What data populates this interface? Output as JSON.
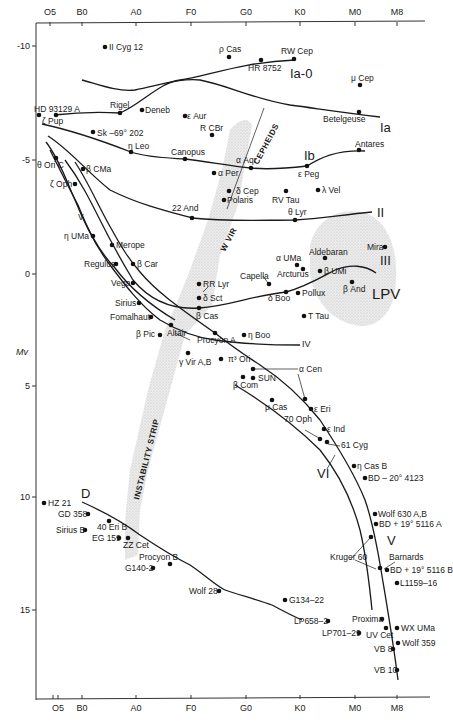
{
  "chart_data": {
    "type": "scatter",
    "xlabel": "Spectral type",
    "ylabel": "Mv",
    "x_ticks": [
      "O5",
      "B0",
      "A0",
      "F0",
      "G0",
      "K0",
      "M0",
      "M8"
    ],
    "y_ticks": [
      "-10",
      "-5",
      "0",
      "5",
      "10",
      "15"
    ],
    "ylim": [
      -11,
      18.5
    ],
    "y_inverted": true,
    "grid": false,
    "luminosity_classes": [
      "Ia-0",
      "Ia",
      "Ib",
      "II",
      "III",
      "IV",
      "V",
      "VI",
      "D"
    ],
    "regions": [
      "CEPHEIDS",
      "W VIR",
      "INSTABILITY STRIP",
      "LPV"
    ],
    "stars": [
      {
        "name": "II Cyg 12",
        "x": 105,
        "y": 47
      },
      {
        "name": "ρ Cas",
        "x": 229,
        "y": 57
      },
      {
        "name": "RW Cep",
        "x": 294,
        "y": 59
      },
      {
        "name": "HR 8752",
        "x": 261,
        "y": 60
      },
      {
        "name": "μ Cep",
        "x": 360,
        "y": 85
      },
      {
        "name": "HD 93129 A",
        "x": 39,
        "y": 115
      },
      {
        "name": "ζ Pup",
        "x": 56,
        "y": 115
      },
      {
        "name": "Rigel",
        "x": 120,
        "y": 113
      },
      {
        "name": "Deneb",
        "x": 142,
        "y": 110
      },
      {
        "name": "ε Aur",
        "x": 185,
        "y": 116
      },
      {
        "name": "Betelgeuse",
        "x": 359,
        "y": 112
      },
      {
        "name": "R CBr",
        "x": 212,
        "y": 135
      },
      {
        "name": "Sk -69° 202",
        "x": 93,
        "y": 132
      },
      {
        "name": "η Leo",
        "x": 131,
        "y": 152
      },
      {
        "name": "Canopus",
        "x": 185,
        "y": 159
      },
      {
        "name": "Antares",
        "x": 359,
        "y": 150
      },
      {
        "name": "α Aqr",
        "x": 251,
        "y": 168
      },
      {
        "name": "ε Peg",
        "x": 307,
        "y": 166
      },
      {
        "name": "θ Ori C",
        "x": 56,
        "y": 158
      },
      {
        "name": "β CMa",
        "x": 83,
        "y": 169
      },
      {
        "name": "α Per",
        "x": 214,
        "y": 173
      },
      {
        "name": "ζ Oph",
        "x": 75,
        "y": 184
      },
      {
        "name": "δ Cep",
        "x": 229,
        "y": 191
      },
      {
        "name": "Polaris",
        "x": 224,
        "y": 200
      },
      {
        "name": "RV Tau",
        "x": 286,
        "y": 191
      },
      {
        "name": "λ Vel",
        "x": 318,
        "y": 190
      },
      {
        "name": "22 And",
        "x": 192,
        "y": 218
      },
      {
        "name": "θ Lyr",
        "x": 295,
        "y": 220
      },
      {
        "name": "η UMa",
        "x": 93,
        "y": 236
      },
      {
        "name": "Merope",
        "x": 112,
        "y": 245
      },
      {
        "name": "Mira",
        "x": 385,
        "y": 247
      },
      {
        "name": "Aldebaran",
        "x": 325,
        "y": 258
      },
      {
        "name": "α UMa",
        "x": 297,
        "y": 265
      },
      {
        "name": "Arcturus",
        "x": 303,
        "y": 269
      },
      {
        "name": "β UMi",
        "x": 320,
        "y": 271
      },
      {
        "name": "Regulus",
        "x": 116,
        "y": 264
      },
      {
        "name": "β Car",
        "x": 133,
        "y": 264
      },
      {
        "name": "β And",
        "x": 352,
        "y": 282
      },
      {
        "name": "Capella",
        "x": 269,
        "y": 284
      },
      {
        "name": "RR Lyr",
        "x": 199,
        "y": 284
      },
      {
        "name": "δ Boo",
        "x": 286,
        "y": 292
      },
      {
        "name": "Pollux",
        "x": 298,
        "y": 293
      },
      {
        "name": "Vega",
        "x": 133,
        "y": 283
      },
      {
        "name": "δ Sct",
        "x": 199,
        "y": 298
      },
      {
        "name": "Sirius",
        "x": 139,
        "y": 303
      },
      {
        "name": "β Cas",
        "x": 199,
        "y": 308
      },
      {
        "name": "T Tau",
        "x": 304,
        "y": 316
      },
      {
        "name": "Fomalhaut",
        "x": 151,
        "y": 317
      },
      {
        "name": "Altair",
        "x": 171,
        "y": 325
      },
      {
        "name": "β Pic",
        "x": 160,
        "y": 335
      },
      {
        "name": "Procyon A",
        "x": 215,
        "y": 333
      },
      {
        "name": "η Boo",
        "x": 244,
        "y": 335
      },
      {
        "name": "γ Vir A,B",
        "x": 188,
        "y": 353
      },
      {
        "name": "π³ Ori",
        "x": 221,
        "y": 359
      },
      {
        "name": "α Cen",
        "x": 253,
        "y": 369
      },
      {
        "name": "SUN",
        "x": 253,
        "y": 378
      },
      {
        "name": "β Com",
        "x": 243,
        "y": 377
      },
      {
        "name": "μ Cas",
        "x": 272,
        "y": 400
      },
      {
        "name": "α Cen (B)",
        "x": 305,
        "y": 399
      },
      {
        "name": "ε Eri",
        "x": 311,
        "y": 409
      },
      {
        "name": "ε Ind",
        "x": 324,
        "y": 429
      },
      {
        "name": "70 Oph",
        "x": 320,
        "y": 439
      },
      {
        "name": "61 Cyg",
        "x": 327,
        "y": 442
      },
      {
        "name": "η Cas B",
        "x": 354,
        "y": 466
      },
      {
        "name": "BD -20° 4123",
        "x": 365,
        "y": 478
      },
      {
        "name": "Wolf 630 A,B",
        "x": 375,
        "y": 514
      },
      {
        "name": "BD +19° 5116 A",
        "x": 376,
        "y": 524
      },
      {
        "name": "Kruger 60",
        "x": 371,
        "y": 537
      },
      {
        "name": "Barnards",
        "x": 380,
        "y": 568
      },
      {
        "name": "BD +19° 5116 B",
        "x": 387,
        "y": 570
      },
      {
        "name": "L1159-16",
        "x": 397,
        "y": 583
      },
      {
        "name": "G134-22",
        "x": 285,
        "y": 600
      },
      {
        "name": "LP658-2",
        "x": 328,
        "y": 621
      },
      {
        "name": "Proxima",
        "x": 382,
        "y": 619
      },
      {
        "name": "WX UMa",
        "x": 397,
        "y": 628
      },
      {
        "name": "UV Cet",
        "x": 386,
        "y": 628
      },
      {
        "name": "LP701-29",
        "x": 359,
        "y": 633
      },
      {
        "name": "Wolf 359",
        "x": 398,
        "y": 643
      },
      {
        "name": "VB 8",
        "x": 393,
        "y": 649
      },
      {
        "name": "VB 10",
        "x": 397,
        "y": 670
      },
      {
        "name": "HZ 21",
        "x": 44,
        "y": 503
      },
      {
        "name": "GD 358",
        "x": 88,
        "y": 514
      },
      {
        "name": "40 Eri B",
        "x": 109,
        "y": 521
      },
      {
        "name": "Sirius B",
        "x": 85,
        "y": 530
      },
      {
        "name": "EG 159",
        "x": 119,
        "y": 538
      },
      {
        "name": "ZZ Cet",
        "x": 128,
        "y": 538
      },
      {
        "name": "Procyon B",
        "x": 170,
        "y": 564
      },
      {
        "name": "G140-2",
        "x": 153,
        "y": 568
      },
      {
        "name": "Wolf 28",
        "x": 219,
        "y": 591
      }
    ]
  },
  "axis": {
    "y_title": "Mv",
    "top_ticks": [
      {
        "label": "O5",
        "x": 50
      },
      {
        "label": "B0",
        "x": 82
      },
      {
        "label": "A0",
        "x": 136
      },
      {
        "label": "F0",
        "x": 191
      },
      {
        "label": "G0",
        "x": 246
      },
      {
        "label": "K0",
        "x": 300
      },
      {
        "label": "M0",
        "x": 355
      },
      {
        "label": "M8",
        "x": 397
      }
    ],
    "bottom_ticks": [
      {
        "label": "O5",
        "x": 58
      },
      {
        "label": "B0",
        "x": 82
      },
      {
        "label": "A0",
        "x": 136
      },
      {
        "label": "F0",
        "x": 191
      },
      {
        "label": "G0",
        "x": 246
      },
      {
        "label": "K0",
        "x": 300
      },
      {
        "label": "M0",
        "x": 355
      },
      {
        "label": "M8",
        "x": 397
      }
    ],
    "left_ticks": [
      {
        "label": "-10",
        "y": 46
      },
      {
        "label": "-5",
        "y": 160
      },
      {
        "label": "0",
        "y": 274
      },
      {
        "label": "5",
        "y": 386
      },
      {
        "label": "10",
        "y": 497
      },
      {
        "label": "15",
        "y": 610
      }
    ]
  },
  "labels": {
    "class_Ia0": "Ia-0",
    "class_Ia": "Ia",
    "class_Ib": "Ib",
    "class_II": "II",
    "class_III": "III",
    "class_IV": "IV",
    "class_V_upper": "V",
    "class_V": "V",
    "class_VI": "VI",
    "class_D": "D",
    "lpv": "LPV",
    "cepheids": "CEPHEIDS",
    "wvir": "W VIR",
    "instability": "INSTABILITY STRIP"
  },
  "star_labels": [
    {
      "text": "II Cyg 12",
      "x": 109,
      "y": 50
    },
    {
      "text": "ρ  Cas",
      "x": 219,
      "y": 52
    },
    {
      "text": "RW Cep",
      "x": 281,
      "y": 54
    },
    {
      "text": "HR 8752",
      "x": 248,
      "y": 71
    },
    {
      "text": "μ  Cep",
      "x": 351,
      "y": 81
    },
    {
      "text": "HD  93129 A",
      "x": 34,
      "y": 112
    },
    {
      "text": "ζ Pup",
      "x": 42,
      "y": 124
    },
    {
      "text": "Rigel",
      "x": 110,
      "y": 108
    },
    {
      "text": "Deneb",
      "x": 145,
      "y": 113
    },
    {
      "text": "ε Aur",
      "x": 187,
      "y": 119
    },
    {
      "text": "R CBr",
      "x": 200,
      "y": 131
    },
    {
      "text": "Sk –69° 202",
      "x": 97,
      "y": 136
    },
    {
      "text": "η Leo",
      "x": 128,
      "y": 149
    },
    {
      "text": "Canopus",
      "x": 171,
      "y": 155
    },
    {
      "text": "Betelgeuse",
      "x": 323,
      "y": 122
    },
    {
      "text": "Antares",
      "x": 355,
      "y": 147
    },
    {
      "text": "α Aqr",
      "x": 236,
      "y": 163
    },
    {
      "text": "ε  Peg",
      "x": 298,
      "y": 177
    },
    {
      "text": "θ Ori C",
      "x": 37,
      "y": 168
    },
    {
      "text": "β  CMa",
      "x": 86,
      "y": 172
    },
    {
      "text": "α Per",
      "x": 218,
      "y": 176
    },
    {
      "text": "ζ  Oph",
      "x": 50,
      "y": 187
    },
    {
      "text": "δ Cep",
      "x": 236,
      "y": 194
    },
    {
      "text": "Polaris",
      "x": 227,
      "y": 203
    },
    {
      "text": "RV Tau",
      "x": 272,
      "y": 203
    },
    {
      "text": "λ  Vel",
      "x": 322,
      "y": 193
    },
    {
      "text": "22  And",
      "x": 172,
      "y": 211
    },
    {
      "text": "θ Lyr",
      "x": 288,
      "y": 215
    },
    {
      "text": "V",
      "x": 78,
      "y": 220
    },
    {
      "text": "η UMa",
      "x": 64,
      "y": 239
    },
    {
      "text": "Merope",
      "x": 116,
      "y": 248
    },
    {
      "text": "Mira",
      "x": 367,
      "y": 250
    },
    {
      "text": "Aldebaran",
      "x": 309,
      "y": 255
    },
    {
      "text": "α  UMa",
      "x": 276,
      "y": 261
    },
    {
      "text": "Arcturus",
      "x": 277,
      "y": 277
    },
    {
      "text": "β UMi",
      "x": 324,
      "y": 274
    },
    {
      "text": "Regulus",
      "x": 84,
      "y": 267
    },
    {
      "text": "β Car",
      "x": 137,
      "y": 267
    },
    {
      "text": "β  And",
      "x": 343,
      "y": 292
    },
    {
      "text": "Capella",
      "x": 240,
      "y": 279
    },
    {
      "text": "RR Lyr",
      "x": 203,
      "y": 287
    },
    {
      "text": "δ  Boo",
      "x": 268,
      "y": 301
    },
    {
      "text": "Pollux",
      "x": 302,
      "y": 296
    },
    {
      "text": "Vega",
      "x": 111,
      "y": 286
    },
    {
      "text": "δ Sct",
      "x": 203,
      "y": 301
    },
    {
      "text": "Sirius",
      "x": 115,
      "y": 306
    },
    {
      "text": "β Cas",
      "x": 196,
      "y": 319
    },
    {
      "text": "T Tau",
      "x": 308,
      "y": 319
    },
    {
      "text": "Fomalhaut",
      "x": 110,
      "y": 320
    },
    {
      "text": "Altair",
      "x": 167,
      "y": 336
    },
    {
      "text": "β  Pic",
      "x": 136,
      "y": 337
    },
    {
      "text": "Procyon A",
      "x": 197,
      "y": 343
    },
    {
      "text": "η Boo",
      "x": 248,
      "y": 338
    },
    {
      "text": "γ  Vir A,B",
      "x": 179,
      "y": 365
    },
    {
      "text": "π³  Ori",
      "x": 228,
      "y": 362
    },
    {
      "text": "α  Cen",
      "x": 299,
      "y": 372
    },
    {
      "text": "SUN",
      "x": 258,
      "y": 381
    },
    {
      "text": "β  Com",
      "x": 233,
      "y": 388
    },
    {
      "text": "μ  Cas",
      "x": 265,
      "y": 410
    },
    {
      "text": "ε  Eri",
      "x": 314,
      "y": 412
    },
    {
      "text": "70  Oph",
      "x": 284,
      "y": 422
    },
    {
      "text": "ε  Ind",
      "x": 327,
      "y": 432
    },
    {
      "text": "61 Cyg",
      "x": 341,
      "y": 448
    },
    {
      "text": "η Cas B",
      "x": 357,
      "y": 469
    },
    {
      "text": "BD – 20° 4123",
      "x": 368,
      "y": 481
    },
    {
      "text": "Wolf 630   A,B",
      "x": 378,
      "y": 517
    },
    {
      "text": "BD + 19° 5116   A",
      "x": 379,
      "y": 527
    },
    {
      "text": "Kruger 60",
      "x": 330,
      "y": 560
    },
    {
      "text": "Barnards",
      "x": 389,
      "y": 560
    },
    {
      "text": "BD + 19° 5116   B",
      "x": 390,
      "y": 573
    },
    {
      "text": "L1159–16",
      "x": 400,
      "y": 586
    },
    {
      "text": "G134–22",
      "x": 289,
      "y": 603
    },
    {
      "text": "LP658–2",
      "x": 294,
      "y": 624
    },
    {
      "text": "Proxima",
      "x": 352,
      "y": 622
    },
    {
      "text": "WX UMa",
      "x": 401,
      "y": 631
    },
    {
      "text": "LP701–29",
      "x": 322,
      "y": 636
    },
    {
      "text": "UV Cet",
      "x": 366,
      "y": 638
    },
    {
      "text": "Wolf 359",
      "x": 402,
      "y": 646
    },
    {
      "text": "VB 8",
      "x": 374,
      "y": 652
    },
    {
      "text": "VB 10",
      "x": 374,
      "y": 673
    },
    {
      "text": "HZ 21",
      "x": 48,
      "y": 506
    },
    {
      "text": "GD 358",
      "x": 58,
      "y": 517
    },
    {
      "text": "40 Eri B",
      "x": 97,
      "y": 530
    },
    {
      "text": "Sirius B",
      "x": 56,
      "y": 533
    },
    {
      "text": "EG 159",
      "x": 92,
      "y": 541
    },
    {
      "text": "ZZ Cet",
      "x": 123,
      "y": 548
    },
    {
      "text": "Procyon B",
      "x": 139,
      "y": 560
    },
    {
      "text": "G140-2",
      "x": 125,
      "y": 571
    },
    {
      "text": "Wolf 28",
      "x": 189,
      "y": 594
    }
  ],
  "colors": {
    "ink": "#1a1a1a",
    "strip_fill": "#d9d9d9",
    "background": "#ffffff"
  }
}
